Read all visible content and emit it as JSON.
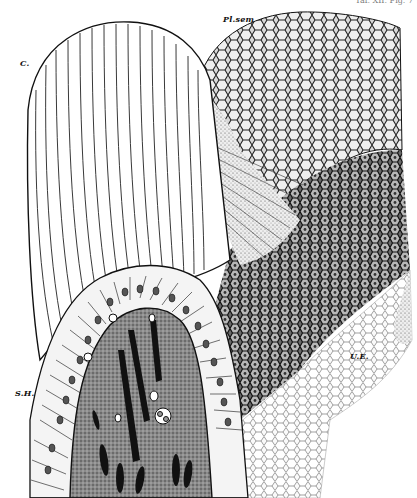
{
  "figure": {
    "header_cutoff": "Taf. XII. Fig. 7",
    "colors": {
      "ink": "#111111",
      "paper": "#ffffff",
      "mid": "#555555"
    },
    "labels": [
      {
        "id": "c",
        "text": "C."
      },
      {
        "id": "plsem",
        "text": "Pl.sem"
      },
      {
        "id": "sh",
        "text": "S.H."
      },
      {
        "id": "ue",
        "text": "U.E."
      }
    ]
  }
}
